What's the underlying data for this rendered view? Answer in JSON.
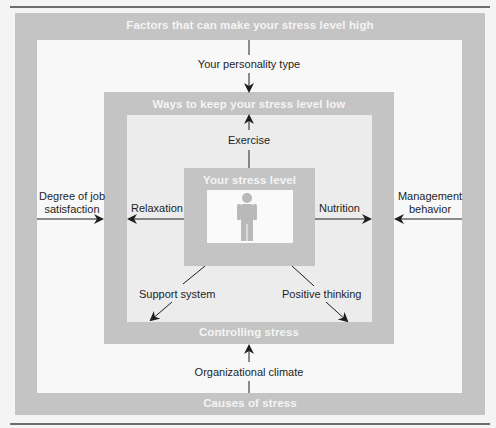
{
  "diagram": {
    "outer_box": {
      "top_label": "Factors that can make your stress level high",
      "bottom_label": "Causes of stress"
    },
    "middle_box": {
      "top_label": "Ways to keep your stress level low",
      "bottom_label": "Controlling stress"
    },
    "center_box": {
      "top_label": "Your stress level",
      "icon": "person-icon"
    },
    "causes": {
      "top": "Your personality type",
      "left_line1": "Degree of job",
      "left_line2": "satisfaction",
      "right_line1": "Management",
      "right_line2": "behavior",
      "bottom": "Organizational climate"
    },
    "controls": {
      "top": "Exercise",
      "left": "Relaxation",
      "right": "Nutrition",
      "bottom_left": "Support system",
      "bottom_right": "Positive thinking"
    },
    "colors": {
      "band_gray": "#c4c4c4",
      "inner_light": "#ececec",
      "arrow": "#1e1e1e",
      "band_text": "#f4f4f4",
      "person_icon": "#b9b9b9"
    }
  }
}
